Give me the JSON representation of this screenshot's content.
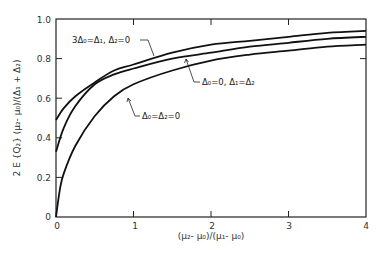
{
  "chart_data": {
    "type": "line",
    "title": "",
    "xlabel": "(μ₂ - μ₀)/(μ₁ - μ₀)",
    "ylabel": "2E{Q₂}(μ₂ - μ₀)/(Δ₁ + Δ₂)",
    "xlim": [
      0,
      4
    ],
    "ylim": [
      0,
      1.0
    ],
    "x_ticks": [
      "0",
      "1",
      "2",
      "3",
      "4"
    ],
    "y_ticks": [
      "0",
      "0.2",
      "0.4",
      "0.6",
      "0.8",
      "1.0"
    ],
    "grid": false,
    "legend": "none (curves annotated directly)",
    "series": [
      {
        "name": "3Δ₀=Δ₁, Δ₂=0",
        "x": [
          0,
          0.1,
          0.25,
          0.5,
          0.75,
          1.0,
          1.5,
          2.0,
          2.5,
          3.0,
          3.5,
          4.0
        ],
        "values": [
          0.49,
          0.55,
          0.61,
          0.68,
          0.74,
          0.77,
          0.83,
          0.87,
          0.89,
          0.91,
          0.93,
          0.94
        ]
      },
      {
        "name": "Δ₀=0, Δ₁=Δ₂",
        "x": [
          0,
          0.1,
          0.25,
          0.5,
          0.75,
          1.0,
          1.5,
          2.0,
          2.5,
          3.0,
          3.5,
          4.0
        ],
        "values": [
          0.33,
          0.45,
          0.56,
          0.67,
          0.72,
          0.75,
          0.8,
          0.83,
          0.86,
          0.88,
          0.9,
          0.91
        ]
      },
      {
        "name": "Δ₀=Δ₂=0",
        "x": [
          0,
          0.05,
          0.1,
          0.25,
          0.5,
          0.75,
          1.0,
          1.5,
          2.0,
          2.5,
          3.0,
          3.5,
          4.0
        ],
        "values": [
          0.0,
          0.14,
          0.22,
          0.36,
          0.51,
          0.61,
          0.67,
          0.74,
          0.79,
          0.82,
          0.84,
          0.86,
          0.87
        ]
      }
    ],
    "annotations": [
      {
        "text": "3Δ₀=Δ₁, Δ₂=0",
        "points_to": "top curve"
      },
      {
        "text": "Δ₀=0, Δ₁=Δ₂",
        "points_to": "middle curve"
      },
      {
        "text": "Δ₀=Δ₂=0",
        "points_to": "bottom curve"
      }
    ]
  },
  "labels": {
    "xlabel": "(μ₂- μ₀)/(μ₁- μ₀)",
    "ylabel": "2 E {Q₂} (μ₂- μ₀)/(Δ₁ + Δ₂)",
    "annot_top": "3Δ₀=Δ₁, Δ₂=0",
    "annot_mid": "Δ₀=0,  Δ₁=Δ₂",
    "annot_bot": "Δ₀=Δ₂=0"
  },
  "colors": {
    "line": "#111111",
    "axis": "#222222",
    "background": "#ffffff"
  }
}
